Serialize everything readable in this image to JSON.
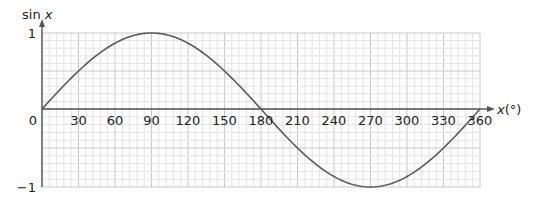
{
  "chart_data": {
    "type": "line",
    "title": "",
    "xlabel": "x(°)",
    "ylabel": "sin x",
    "xlim": [
      0,
      360
    ],
    "ylim": [
      -1,
      1
    ],
    "x_ticks": [
      0,
      30,
      60,
      90,
      120,
      150,
      180,
      210,
      240,
      270,
      300,
      330,
      360
    ],
    "x_tick_labels": [
      "0",
      "30",
      "60",
      "90",
      "120",
      "150",
      "180",
      "210",
      "240",
      "270",
      "300",
      "330",
      "360"
    ],
    "y_ticks": [
      -1,
      0,
      1
    ],
    "y_tick_labels": [
      "−1",
      "0",
      "1"
    ],
    "grid": {
      "on": true,
      "x_major_step": 30,
      "x_minor_step": 6,
      "y_major_step": 0.5,
      "y_minor_step": 0.1
    },
    "legend": null,
    "series": [
      {
        "name": "sin x",
        "function": "sin(x°)",
        "x": [
          0,
          30,
          60,
          90,
          120,
          150,
          180,
          210,
          240,
          270,
          300,
          330,
          360
        ],
        "values": [
          0,
          0.5,
          0.866,
          1,
          0.866,
          0.5,
          0,
          -0.5,
          -0.866,
          -1,
          -0.866,
          -0.5,
          0
        ]
      }
    ]
  },
  "colors": {
    "curve": "#5a5a5a",
    "axis": "#555555",
    "grid_minor": "#e4e4e4",
    "grid_major": "#c8c8c8",
    "text": "#222222"
  }
}
